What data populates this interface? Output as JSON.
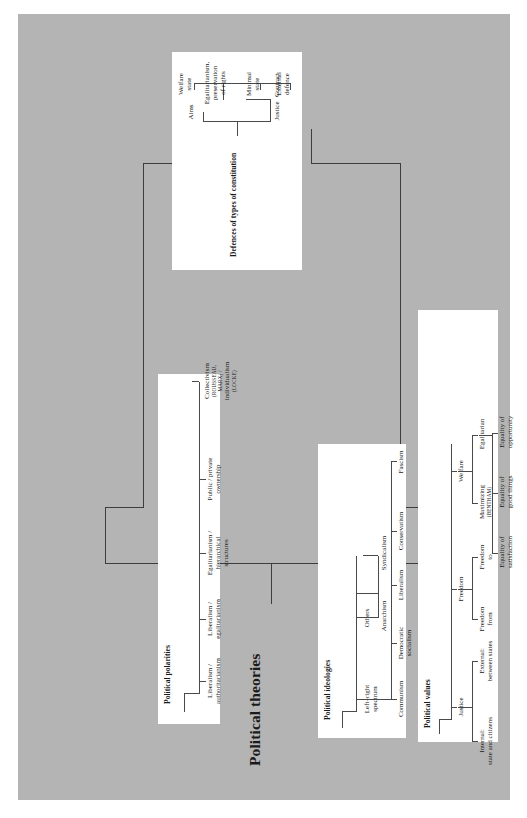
{
  "diagram": {
    "type": "tree",
    "title": "Political theories",
    "panel_color": "#b4b4b4",
    "box_color": "#ffffff",
    "line_color": "#4a4a4a",
    "branches": [
      {
        "id": "political-polarities",
        "title": "Political polarities",
        "children": [
          {
            "label": "Liberalism /\nauthoritarianism"
          },
          {
            "label": "Liberalism /\negalitarianism"
          },
          {
            "label": "Egalitarianism /\nhierarchical\nstructures"
          },
          {
            "label": "Public / private\nownership"
          },
          {
            "label": "Collectivism",
            "smallcaps1": "(ROUSSEAU,",
            "smallcaps2": "MARX) /",
            "label2": "individualism",
            "smallcaps3": "(LOCKE)"
          }
        ]
      },
      {
        "id": "defences-of-types-of-constitution",
        "title": "Defences of types of constitution",
        "children": [
          {
            "label": "Justice",
            "children": [
              {
                "label": "Contract",
                "children": [
                  {
                    "label": "External\ndefence"
                  },
                  {
                    "label": "Minimal\nstate"
                  }
                ]
              }
            ]
          },
          {
            "label": "Aims",
            "children": [
              {
                "label": "Egalitarianism,\npreservation\nof rights"
              },
              {
                "label": "Welfare\nstate"
              }
            ]
          }
        ]
      },
      {
        "id": "political-ideologies",
        "title": "Political ideologies",
        "children": [
          {
            "label": "Left–right\nspectrum",
            "children": [
              {
                "label": "Communism"
              },
              {
                "label": "Democratic\nsocialism"
              },
              {
                "label": "Liberalism"
              },
              {
                "label": "Conservatism"
              },
              {
                "label": "Fascism"
              }
            ]
          },
          {
            "label": "Others",
            "children": [
              {
                "label": "Anarchism"
              },
              {
                "label": "Syndicalism"
              }
            ]
          }
        ]
      },
      {
        "id": "political-values",
        "title": "Political values",
        "children": [
          {
            "label": "Justice",
            "children": [
              {
                "label": "Internal:\nstate and citizens"
              },
              {
                "label": "External:\nbetween states"
              }
            ]
          },
          {
            "label": "Freedom",
            "children": [
              {
                "label": "Freedom\nfrom"
              },
              {
                "label": "Freedom\nto"
              }
            ]
          },
          {
            "label": "Welfare",
            "children": [
              {
                "label": "Maximizing",
                "smallcaps1": "(BENTHAM)"
              },
              {
                "label": "Egalitarian"
              }
            ],
            "grandchildren": [
              {
                "label": "Equality of\nsatisfaction"
              },
              {
                "label": "Equality of\ngood things"
              },
              {
                "label": "Equality of\nopportunity"
              }
            ]
          }
        ]
      }
    ]
  },
  "labels": {
    "main_title": "Political theories",
    "pol_title": "Political polarities",
    "pol_1": "Liberalism /\nauthoritarianism",
    "pol_2": "Liberalism /\negalitarianism",
    "pol_3": "Egalitarianism /\nhierarchical\nstructures",
    "pol_4": "Public / private\nownership",
    "pol_5a": "Collectivism",
    "pol_5b": "(ROUSSEAU,",
    "pol_5c": "MARX) /",
    "pol_5d": "individualism",
    "pol_5e": "(LOCKE)",
    "con_title": "Defences of types of constitution",
    "con_justice": "Justice",
    "con_contract": "Contract",
    "con_aims": "Aims",
    "con_external": "External\ndefence",
    "con_minimal": "Minimal\nstate",
    "con_egal": "Egalitarianism,\npreservation\nof rights",
    "con_welfare": "Welfare\nstate",
    "ide_title": "Political ideologies",
    "ide_leftright": "Left–right\nspectrum",
    "ide_others": "Others",
    "ide_communism": "Communism",
    "ide_demsoc": "Democratic\nsocialism",
    "ide_liberalism": "Liberalism",
    "ide_conservatism": "Conservatism",
    "ide_fascism": "Fascism",
    "ide_anarchism": "Anarchism",
    "ide_syndicalism": "Syndicalism",
    "val_title": "Political values",
    "val_justice": "Justice",
    "val_freedom": "Freedom",
    "val_welfare": "Welfare",
    "val_internal": "Internal:\nstate and citizens",
    "val_external": "External:\nbetween states",
    "val_freedom_from": "Freedom\nfrom",
    "val_freedom_to": "Freedom\nto",
    "val_maximizing": "Maximizing",
    "val_bentham": "(BENTHAM)",
    "val_egalitarian": "Egalitarian",
    "val_eq_sat": "Equality of\nsatisfaction",
    "val_eq_good": "Equality of\ngood things",
    "val_eq_opp": "Equality of\nopportunity"
  }
}
